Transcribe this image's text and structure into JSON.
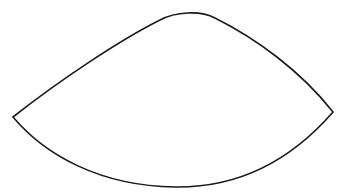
{
  "figure": {
    "background": "#ffffff",
    "shape": {
      "type": "curved-lens-outline",
      "stroke_color": "#1a1a1a",
      "stroke_width": 1.6,
      "fill": "none",
      "points": {
        "left_corner": [
          13,
          117
        ],
        "right_corner": [
          333,
          112
        ],
        "top_peak": [
          188,
          13
        ],
        "bottom_low": [
          175,
          187
        ]
      }
    }
  }
}
